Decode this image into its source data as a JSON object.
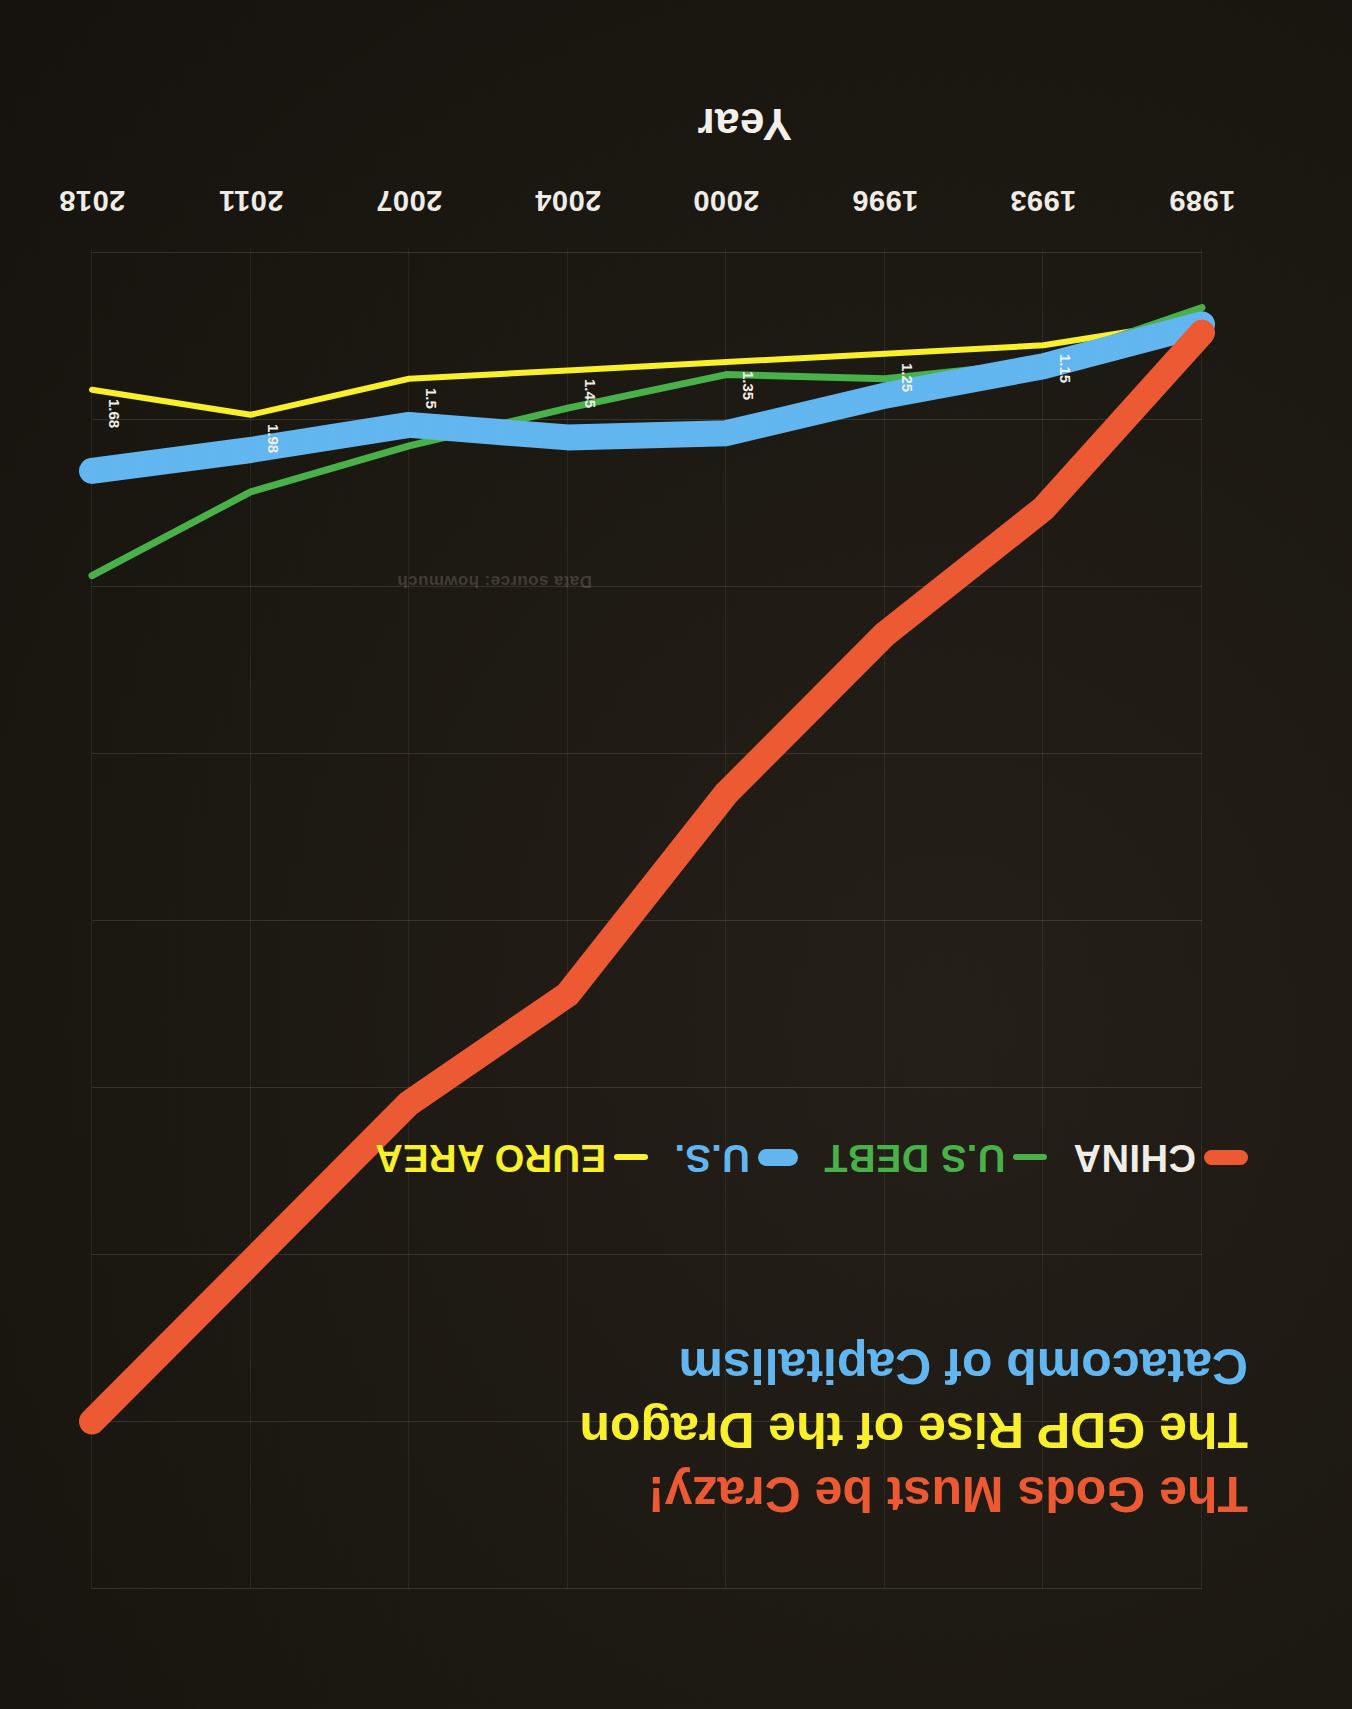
{
  "titles": {
    "line1": "The Gods Must be Crazy!",
    "line2": "The GDP Rise of the Dragon",
    "line3": "Catacomb of Capitalism",
    "line1_color": "#ef5a33",
    "line2_color": "#fbf32a",
    "line3_color": "#63b8f2"
  },
  "legend": {
    "items": [
      {
        "label": "CHINA",
        "color": "#ef5a33",
        "text_color": "#f3f0ea"
      },
      {
        "label": "U.S DEBT",
        "color": "#49b24a",
        "text_color": "#49b24a"
      },
      {
        "label": "U.S.",
        "color": "#63b8f2",
        "text_color": "#63b8f2"
      },
      {
        "label": "EURO AREA",
        "color": "#fbf32a",
        "text_color": "#fbf32a"
      }
    ]
  },
  "watermark": "Data source: howmuch",
  "axes": {
    "x_title": "Year",
    "y_title": "Growth Levels",
    "y_ticks": [
      "16",
      "14",
      "12",
      "10",
      "8",
      "6",
      "4",
      "2",
      "0"
    ],
    "x_ticks": [
      "1989",
      "1993",
      "1996",
      "2000",
      "2004",
      "2007",
      "2011",
      "2018"
    ]
  },
  "chart_data": {
    "type": "line",
    "xlabel": "Year",
    "ylabel": "Growth Levels",
    "categories": [
      "1989",
      "1993",
      "1996",
      "2000",
      "2004",
      "2007",
      "2011",
      "2018"
    ],
    "ylim": [
      0,
      16
    ],
    "yticks": [
      0,
      2,
      4,
      6,
      8,
      10,
      12,
      14,
      16
    ],
    "grid": true,
    "legend_position": "below-title-left",
    "series": [
      {
        "name": "CHINA",
        "color": "#ef5a33",
        "values": [
          1.0,
          3.1,
          4.6,
          6.5,
          8.9,
          10.2,
          12.1,
          14.0
        ]
      },
      {
        "name": "U.S DEBT",
        "color": "#49b24a",
        "values": [
          0.7,
          1.35,
          1.55,
          1.5,
          1.9,
          2.35,
          2.9,
          3.9
        ]
      },
      {
        "name": "U.S.",
        "color": "#63b8f2",
        "values": [
          0.9,
          1.4,
          1.75,
          2.2,
          2.25,
          2.1,
          2.4,
          2.65
        ]
      },
      {
        "name": "EURO AREA",
        "color": "#fbf32a",
        "values": [
          0.85,
          1.15,
          1.25,
          1.35,
          1.45,
          1.55,
          1.98,
          1.68
        ]
      }
    ],
    "data_labels": [
      {
        "series": "EURO AREA",
        "x": "1993",
        "text": "1.15"
      },
      {
        "series": "EURO AREA",
        "x": "1996",
        "text": "1.25"
      },
      {
        "series": "EURO AREA",
        "x": "2000",
        "text": "1.35"
      },
      {
        "series": "EURO AREA",
        "x": "2004",
        "text": "1.45"
      },
      {
        "series": "EURO AREA",
        "x": "2007",
        "text": "1.5"
      },
      {
        "series": "EURO AREA",
        "x": "2011",
        "text": "1.98"
      },
      {
        "series": "EURO AREA",
        "x": "2018",
        "text": "1.68"
      }
    ]
  }
}
